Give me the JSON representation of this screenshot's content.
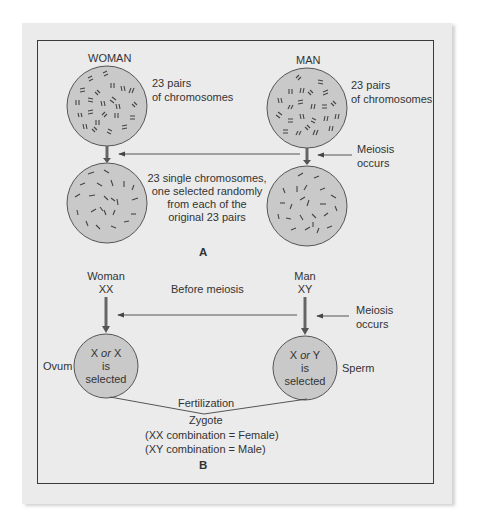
{
  "panel_a": {
    "woman_label": "WOMAN",
    "man_label": "MAN",
    "woman_pairs_line1": "23 pairs",
    "woman_pairs_line2": "of chromosomes",
    "man_pairs_line1": "23 pairs",
    "man_pairs_line2": "of chromosomes",
    "meiosis_line1": "Meiosis",
    "meiosis_line2": "occurs",
    "single_line1": "23 single chromosomes,",
    "single_line2": "one selected randomly",
    "single_line3": "from each of the",
    "single_line4": "original 23 pairs",
    "panel_label": "A"
  },
  "panel_b": {
    "woman_label": "Woman",
    "woman_genotype": "XX",
    "man_label": "Man",
    "man_genotype": "XY",
    "before_meiosis": "Before meiosis",
    "meiosis_line1": "Meiosis",
    "meiosis_line2": "occurs",
    "ovum_label": "Ovum",
    "sperm_label": "Sperm",
    "ovum_circle": {
      "x1": "X",
      "or": "or",
      "x2": "X",
      "line2": "is",
      "line3": "selected"
    },
    "sperm_circle": {
      "x1": "X",
      "or": "or",
      "x2": "Y",
      "line2": "is",
      "line3": "selected"
    },
    "fertilization": "Fertilization",
    "zygote": "Zygote",
    "female_combo": "(XX combination = Female)",
    "male_combo": "(XY combination = Male)",
    "panel_label": "B"
  },
  "colors": {
    "card_bg": "#ebebeb",
    "circle_fill": "#c9c9c9",
    "line": "#444444",
    "arrow": "#666666"
  }
}
